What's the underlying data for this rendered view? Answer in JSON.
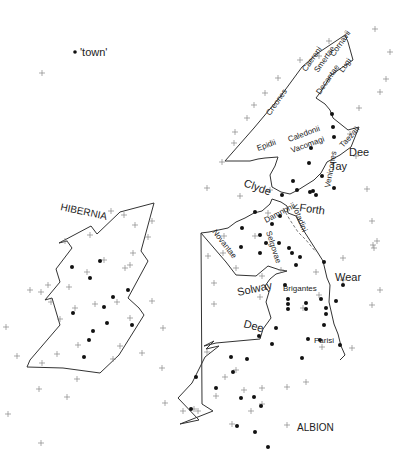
{
  "legend": {
    "symbol": "dot",
    "label": "'town'"
  },
  "regions": [
    {
      "name": "HIBERNIA",
      "x": 60,
      "y": 210,
      "rotate": 12
    },
    {
      "name": "ALBION",
      "x": 297,
      "y": 431,
      "rotate": 0
    }
  ],
  "rivers": [
    {
      "name": "Dee",
      "x": 349,
      "y": 156,
      "rotate": 0
    },
    {
      "name": "Tay",
      "x": 330,
      "y": 170,
      "rotate": 0
    },
    {
      "name": "Clyde",
      "x": 243,
      "y": 186,
      "rotate": 20
    },
    {
      "name": "Forth",
      "x": 299,
      "y": 211,
      "rotate": 8
    },
    {
      "name": "Solway",
      "x": 238,
      "y": 296,
      "rotate": -12
    },
    {
      "name": "Wear",
      "x": 335,
      "y": 281,
      "rotate": 0
    },
    {
      "name": "Dee",
      "x": 243,
      "y": 327,
      "rotate": 15
    }
  ],
  "tribes": [
    {
      "name": "Caereni",
      "x": 306,
      "y": 72,
      "rotate": -55
    },
    {
      "name": "Smertae",
      "x": 318,
      "y": 73,
      "rotate": -55
    },
    {
      "name": "Cornavii",
      "x": 334,
      "y": 57,
      "rotate": -55
    },
    {
      "name": "Lugi",
      "x": 343,
      "y": 73,
      "rotate": -55
    },
    {
      "name": "Decantae",
      "x": 320,
      "y": 95,
      "rotate": -55
    },
    {
      "name": "Creones",
      "x": 270,
      "y": 116,
      "rotate": -55
    },
    {
      "name": "Epidii",
      "x": 258,
      "y": 151,
      "rotate": -20
    },
    {
      "name": "Caledonii",
      "x": 289,
      "y": 142,
      "rotate": -20
    },
    {
      "name": "Vacomagi",
      "x": 292,
      "y": 153,
      "rotate": -20
    },
    {
      "name": "Taezali",
      "x": 343,
      "y": 148,
      "rotate": -48
    },
    {
      "name": "Venicones",
      "x": 330,
      "y": 188,
      "rotate": -80
    },
    {
      "name": "Damnonii",
      "x": 266,
      "y": 223,
      "rotate": -28
    },
    {
      "name": "Votadini",
      "x": 292,
      "y": 206,
      "rotate": 68
    },
    {
      "name": "Novantae",
      "x": 212,
      "y": 232,
      "rotate": 52
    },
    {
      "name": "Selgovae",
      "x": 266,
      "y": 232,
      "rotate": 72
    },
    {
      "name": "Brigantes",
      "x": 283,
      "y": 291,
      "rotate": 0
    },
    {
      "name": "Parisi",
      "x": 314,
      "y": 343,
      "rotate": 0
    }
  ],
  "towns": [
    [
      332,
      114
    ],
    [
      333,
      127
    ],
    [
      334,
      137
    ],
    [
      311,
      148
    ],
    [
      309,
      163
    ],
    [
      322,
      176
    ],
    [
      334,
      188
    ],
    [
      293,
      181
    ],
    [
      297,
      190
    ],
    [
      313,
      191
    ],
    [
      310,
      192
    ],
    [
      316,
      195
    ],
    [
      282,
      195
    ],
    [
      255,
      212
    ],
    [
      280,
      216
    ],
    [
      272,
      224
    ],
    [
      242,
      228
    ],
    [
      260,
      235
    ],
    [
      266,
      243
    ],
    [
      241,
      247
    ],
    [
      260,
      253
    ],
    [
      292,
      253
    ],
    [
      279,
      243
    ],
    [
      289,
      248
    ],
    [
      300,
      257
    ],
    [
      324,
      262
    ],
    [
      296,
      265
    ],
    [
      285,
      285
    ],
    [
      336,
      301
    ],
    [
      343,
      285
    ],
    [
      288,
      299
    ],
    [
      288,
      304
    ],
    [
      288,
      309
    ],
    [
      306,
      303
    ],
    [
      306,
      309
    ],
    [
      321,
      299
    ],
    [
      326,
      308
    ],
    [
      326,
      314
    ],
    [
      324,
      325
    ],
    [
      340,
      345
    ],
    [
      276,
      328
    ],
    [
      259,
      336
    ],
    [
      272,
      344
    ],
    [
      308,
      339
    ],
    [
      320,
      340
    ],
    [
      302,
      358
    ],
    [
      231,
      357
    ],
    [
      247,
      359
    ],
    [
      196,
      377
    ],
    [
      233,
      372
    ],
    [
      216,
      388
    ],
    [
      191,
      409
    ],
    [
      241,
      398
    ],
    [
      254,
      397
    ],
    [
      261,
      406
    ],
    [
      237,
      426
    ],
    [
      255,
      432
    ],
    [
      268,
      447
    ],
    [
      100,
      261
    ],
    [
      72,
      267
    ],
    [
      90,
      278
    ],
    [
      128,
      290
    ],
    [
      113,
      297
    ],
    [
      104,
      307
    ],
    [
      73,
      313
    ],
    [
      107,
      323
    ],
    [
      93,
      331
    ],
    [
      132,
      325
    ],
    [
      89,
      340
    ],
    [
      84,
      357
    ]
  ],
  "crosses": [
    [
      42,
      73
    ],
    [
      375,
      29
    ],
    [
      329,
      41
    ],
    [
      319,
      56
    ],
    [
      300,
      60
    ],
    [
      278,
      78
    ],
    [
      265,
      93
    ],
    [
      254,
      105
    ],
    [
      247,
      118
    ],
    [
      235,
      132
    ],
    [
      234,
      143
    ],
    [
      222,
      162
    ],
    [
      207,
      188
    ],
    [
      240,
      196
    ],
    [
      270,
      190
    ],
    [
      268,
      213
    ],
    [
      255,
      236
    ],
    [
      224,
      236
    ],
    [
      223,
      253
    ],
    [
      236,
      268
    ],
    [
      208,
      256
    ],
    [
      214,
      283
    ],
    [
      214,
      304
    ],
    [
      262,
      276
    ],
    [
      281,
      270
    ],
    [
      260,
      297
    ],
    [
      319,
      295
    ],
    [
      343,
      258
    ],
    [
      343,
      280
    ],
    [
      372,
      305
    ],
    [
      303,
      308
    ],
    [
      316,
      272
    ],
    [
      322,
      347
    ],
    [
      352,
      348
    ],
    [
      287,
      387
    ],
    [
      262,
      388
    ],
    [
      306,
      382
    ],
    [
      244,
      390
    ],
    [
      262,
      404
    ],
    [
      287,
      425
    ],
    [
      251,
      411
    ],
    [
      232,
      424
    ],
    [
      216,
      396
    ],
    [
      225,
      377
    ],
    [
      194,
      409
    ],
    [
      198,
      411
    ],
    [
      236,
      370
    ],
    [
      207,
      352
    ],
    [
      183,
      411
    ],
    [
      373,
      245
    ],
    [
      377,
      241
    ],
    [
      380,
      290
    ],
    [
      390,
      52
    ],
    [
      386,
      79
    ],
    [
      380,
      92
    ],
    [
      359,
      108
    ],
    [
      350,
      134
    ],
    [
      356,
      156
    ],
    [
      367,
      189
    ],
    [
      372,
      221
    ],
    [
      374,
      248
    ],
    [
      148,
      237
    ],
    [
      152,
      221
    ],
    [
      135,
      225
    ],
    [
      124,
      215
    ],
    [
      111,
      211
    ],
    [
      65,
      241
    ],
    [
      90,
      235
    ],
    [
      133,
      253
    ],
    [
      130,
      265
    ],
    [
      104,
      260
    ],
    [
      125,
      268
    ],
    [
      87,
      272
    ],
    [
      69,
      287
    ],
    [
      41,
      292
    ],
    [
      48,
      285
    ],
    [
      30,
      290
    ],
    [
      51,
      302
    ],
    [
      95,
      304
    ],
    [
      117,
      302
    ],
    [
      152,
      301
    ],
    [
      130,
      318
    ],
    [
      163,
      328
    ],
    [
      75,
      308
    ],
    [
      60,
      319
    ],
    [
      78,
      345
    ],
    [
      57,
      354
    ],
    [
      120,
      346
    ],
    [
      142,
      353
    ],
    [
      162,
      368
    ],
    [
      113,
      359
    ],
    [
      67,
      397
    ],
    [
      39,
      389
    ],
    [
      77,
      379
    ],
    [
      6,
      327
    ],
    [
      8,
      414
    ],
    [
      41,
      443
    ],
    [
      165,
      403
    ],
    [
      42,
      363
    ],
    [
      17,
      356
    ]
  ]
}
